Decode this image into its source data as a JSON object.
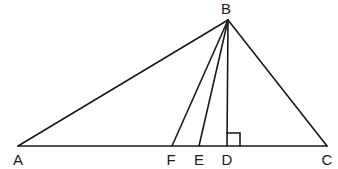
{
  "diagram": {
    "type": "geometry-triangle",
    "points": {
      "A": {
        "label": "A",
        "x": 18,
        "y": 146
      },
      "B": {
        "label": "B",
        "x": 228,
        "y": 20
      },
      "F": {
        "label": "F",
        "x": 172,
        "y": 146
      },
      "E": {
        "label": "E",
        "x": 199,
        "y": 146
      },
      "D": {
        "label": "D",
        "x": 227,
        "y": 146
      },
      "C": {
        "label": "C",
        "x": 327,
        "y": 146
      }
    },
    "segments": [
      "AB",
      "BC",
      "AC",
      "BF",
      "BE",
      "BD"
    ],
    "annotations": {
      "right_angle_at": "D"
    },
    "line_color": "#1a1a1a"
  }
}
